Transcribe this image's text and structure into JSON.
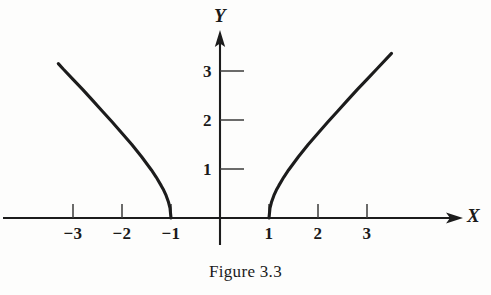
{
  "figure": {
    "caption": "Figure 3.3",
    "background_color": "#fdfdfc",
    "ink_color": "#1c1c1c"
  },
  "axes": {
    "x_axis_label": "X",
    "y_axis_label": "Y",
    "origin_px": {
      "x": 220,
      "y": 218
    },
    "unit_px": 49
  },
  "ticks": {
    "x": [
      {
        "value": -3,
        "label": "−3"
      },
      {
        "value": -2,
        "label": "−2"
      },
      {
        "value": -1,
        "label": "−1"
      },
      {
        "value": 1,
        "label": "1"
      },
      {
        "value": 2,
        "label": "2"
      },
      {
        "value": 3,
        "label": "3"
      }
    ],
    "y": [
      {
        "value": 1,
        "label": "1"
      },
      {
        "value": 2,
        "label": "2"
      },
      {
        "value": 3,
        "label": "3"
      }
    ]
  },
  "chart_data": {
    "type": "line",
    "title": "Figure 3.3",
    "xlabel": "X",
    "ylabel": "Y",
    "xlim": [
      -4.4,
      5.5
    ],
    "ylim": [
      -1.1,
      3.8
    ],
    "grid": false,
    "legend": null,
    "axis_style": "arrowed-cartesian",
    "x_ticks": [
      -3,
      -2,
      -1,
      1,
      2,
      3
    ],
    "x_tick_labels": [
      "−3",
      "−2",
      "−1",
      "1",
      "2",
      "3"
    ],
    "y_ticks": [
      1,
      2,
      3
    ],
    "y_tick_labels": [
      "1",
      "2",
      "3"
    ],
    "series": [
      {
        "name": "left-branch",
        "comment": "y = sqrt(x^2 - 1) for x <= -1",
        "x": [
          -3.3,
          -3.2,
          -3.0,
          -2.8,
          -2.6,
          -2.4,
          -2.2,
          -2.0,
          -1.8,
          -1.6,
          -1.4,
          -1.3,
          -1.2,
          -1.15,
          -1.1,
          -1.05,
          -1.02,
          -1.0
        ],
        "y": [
          3.15,
          3.04,
          2.83,
          2.62,
          2.4,
          2.18,
          1.96,
          1.73,
          1.5,
          1.25,
          0.98,
          0.83,
          0.66,
          0.57,
          0.46,
          0.32,
          0.2,
          0.0
        ]
      },
      {
        "name": "right-branch",
        "comment": "y = sqrt(x^2 - 1) for x >= 1",
        "x": [
          1.0,
          1.02,
          1.05,
          1.1,
          1.15,
          1.2,
          1.3,
          1.4,
          1.6,
          1.8,
          2.0,
          2.2,
          2.4,
          2.6,
          2.8,
          3.0,
          3.2,
          3.5
        ],
        "y": [
          0.0,
          0.2,
          0.32,
          0.46,
          0.57,
          0.66,
          0.83,
          0.98,
          1.25,
          1.5,
          1.73,
          1.96,
          2.18,
          2.4,
          2.62,
          2.83,
          3.04,
          3.36
        ]
      }
    ]
  }
}
